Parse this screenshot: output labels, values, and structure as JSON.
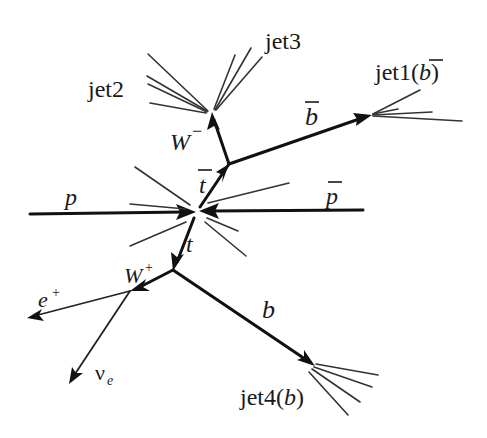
{
  "diagram": {
    "labels": {
      "p": "p",
      "pbar": "p",
      "t": "t",
      "tbar": "t",
      "w_minus": "W",
      "w_minus_sup": "−",
      "w_plus": "W",
      "w_plus_sup": "+",
      "b": "b",
      "bbar": "b",
      "e_plus": "e",
      "e_plus_sup": "+",
      "nu_e": "ν",
      "nu_e_sub": "e",
      "jet1": "jet1(",
      "jet1_b": "b",
      "jet1_close": ")",
      "jet2": "jet2",
      "jet3": "jet3",
      "jet4": "jet4(",
      "jet4_b": "b",
      "jet4_close": ")"
    },
    "nodes": {
      "collision_vertex": [
        197,
        212
      ],
      "tbar_decay_vertex": [
        229,
        164
      ],
      "t_decay_vertex": [
        173,
        270
      ],
      "w_minus_vertex": [
        212,
        113
      ],
      "w_plus_vertex": [
        130,
        290
      ],
      "jet1_vertex": [
        372,
        115
      ],
      "jet4_vertex": [
        315,
        366
      ]
    },
    "edges": [
      {
        "from": "p_in",
        "to": "collision_vertex",
        "particle": "p",
        "arrow": true
      },
      {
        "from": "pbar_in",
        "to": "collision_vertex",
        "particle": "pbar",
        "arrow": true
      },
      {
        "from": "collision_vertex",
        "to": "tbar_decay_vertex",
        "particle": "tbar",
        "arrow": true
      },
      {
        "from": "collision_vertex",
        "to": "t_decay_vertex",
        "particle": "t",
        "arrow": true
      },
      {
        "from": "tbar_decay_vertex",
        "to": "w_minus_vertex",
        "particle": "W-",
        "arrow": true
      },
      {
        "from": "tbar_decay_vertex",
        "to": "jet1_vertex",
        "particle": "bbar",
        "arrow": true
      },
      {
        "from": "t_decay_vertex",
        "to": "w_plus_vertex",
        "particle": "W+",
        "arrow": true
      },
      {
        "from": "t_decay_vertex",
        "to": "jet4_vertex",
        "particle": "b",
        "arrow": true
      },
      {
        "from": "w_plus_vertex",
        "to": "e_plus_out",
        "particle": "e+",
        "arrow": true
      },
      {
        "from": "w_plus_vertex",
        "to": "nu_out",
        "particle": "nu_e",
        "arrow": true
      },
      {
        "from": "w_minus_vertex",
        "to": "jet2",
        "particle": "jet2"
      },
      {
        "from": "w_minus_vertex",
        "to": "jet3",
        "particle": "jet3"
      }
    ]
  }
}
